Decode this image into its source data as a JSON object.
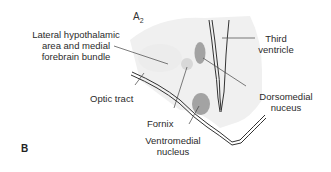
{
  "figure": {
    "panel_letter": "B",
    "section_id": "A",
    "section_subscript": "2",
    "colors": {
      "background_region": "#eeeeee",
      "nucleus_dark": "#a3a3a3",
      "fornix_light": "#d6d6d6",
      "outline": "#333333",
      "leader_line": "#444444"
    },
    "labels": {
      "lateral_hypothalamic": [
        "Lateral hypothalamic",
        "area and medial",
        "forebrain bundle"
      ],
      "third_ventricle": [
        "Third",
        "ventricle"
      ],
      "optic_tract": "Optic tract",
      "dorsomedial": [
        "Dorsomedial",
        "nuceus"
      ],
      "fornix": "Fornix",
      "ventromedial": [
        "Ventromedial",
        "nucleus"
      ]
    }
  }
}
